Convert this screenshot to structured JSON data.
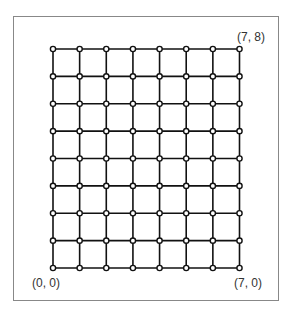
{
  "diagram": {
    "type": "grid-graph",
    "columns": 8,
    "rows": 9,
    "x_range": [
      0,
      7
    ],
    "y_range": [
      0,
      8
    ],
    "labels": {
      "top_right": "(7, 8)",
      "bottom_left": "(0, 0)",
      "bottom_right": "(7, 0)"
    },
    "colors": {
      "line": "#111111",
      "node_fill": "#ffffff",
      "frame": "#888888"
    }
  }
}
